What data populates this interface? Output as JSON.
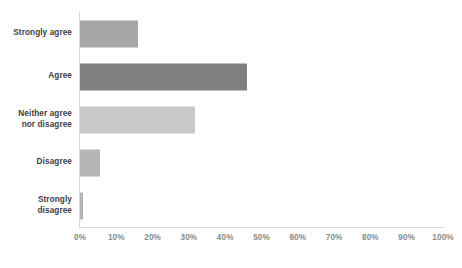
{
  "chart_data": {
    "type": "bar",
    "orientation": "horizontal",
    "title": "",
    "subtitle": "",
    "xlabel": "",
    "ylabel": "",
    "categories": [
      "Strongly agree",
      "Agree",
      "Neither agree\nnor disagree",
      "Disagree",
      "Strongly\ndisagree"
    ],
    "values": [
      16,
      46,
      31.7,
      5.5,
      0.8
    ],
    "value_unit": "%",
    "bar_colors": [
      "#a6a6a6",
      "#7f7f7f",
      "#c8c8c8",
      "#b5b5b5",
      "#b5b5b5"
    ],
    "xlim": [
      0,
      100
    ],
    "x_ticks": [
      0,
      10,
      20,
      30,
      40,
      50,
      60,
      70,
      80,
      90,
      100
    ],
    "x_tick_labels": [
      "0%",
      "10%",
      "20%",
      "30%",
      "40%",
      "50%",
      "60%",
      "70%",
      "80%",
      "90%",
      "100%"
    ],
    "grid": false,
    "legend": false,
    "axis_color": "#d9d9d9",
    "tick_label_color": "#8a8a8a",
    "category_label_color": "#3d3d3d",
    "background": "#ffffff"
  }
}
